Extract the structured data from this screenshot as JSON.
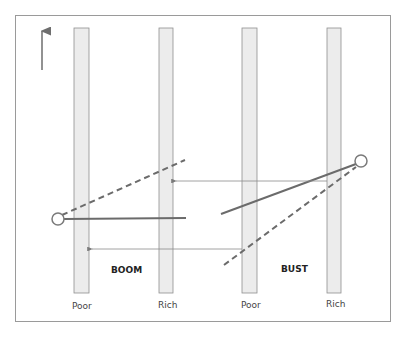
{
  "diagram": {
    "colors": {
      "frame": "#9a9a9a",
      "bar_fill": "#ececec",
      "bar_stroke": "#8f8f8f",
      "line": "#6b6b6b",
      "arrow": "#8a8a8a"
    },
    "axis_arrow": "up-arrow",
    "columns": [
      {
        "label": "Poor"
      },
      {
        "label": "Rich"
      },
      {
        "label": "Poor"
      },
      {
        "label": "Rich"
      }
    ],
    "panels": [
      {
        "label": "BOOM"
      },
      {
        "label": "BUST"
      }
    ]
  }
}
